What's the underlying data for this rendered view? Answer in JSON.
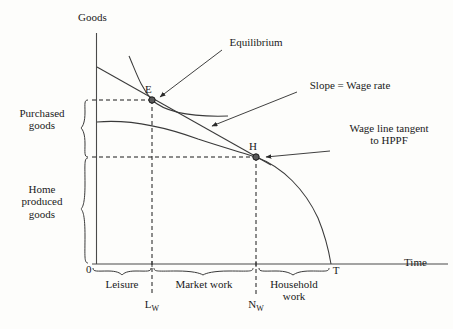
{
  "figure": {
    "type": "economics-diagram",
    "title_axes": {
      "y_axis_label": "Goods",
      "x_axis_label": "Time",
      "origin_label": "0"
    },
    "axis_ticks": {
      "x": [
        {
          "name": "L_W",
          "label": "L",
          "sub": "W",
          "x": 152
        },
        {
          "name": "N_W",
          "label": "N",
          "sub": "W",
          "x": 256
        },
        {
          "name": "T",
          "label": "T",
          "sub": "",
          "x": 331
        }
      ]
    },
    "points": [
      {
        "name": "E",
        "label": "E",
        "x": 152,
        "y": 100,
        "description": "Equilibrium point on indifference curve and wage line"
      },
      {
        "name": "H",
        "label": "H",
        "x": 256,
        "y": 157,
        "description": "Tangency of wage line to HPPF"
      }
    ],
    "annotations": [
      {
        "name": "equilibrium",
        "lines": [
          "Equilibrium"
        ],
        "x": 225,
        "y": 36
      },
      {
        "name": "slope-wage-rate",
        "lines": [
          "Slope = Wage rate"
        ],
        "x": 300,
        "y": 79
      },
      {
        "name": "wage-line-tangent",
        "lines": [
          "Wage line tangent",
          "to HPPF"
        ],
        "x": 333,
        "y": 122
      }
    ],
    "vertical_brackets": [
      {
        "name": "purchased-goods",
        "lines": [
          "Purchased",
          "goods"
        ],
        "top": 100,
        "bottom": 157,
        "label_x": 42,
        "label_y": 114
      },
      {
        "name": "home-produced-goods",
        "lines": [
          "Home",
          "produced",
          "goods"
        ],
        "top": 158,
        "bottom": 263,
        "label_x": 42,
        "label_y": 188
      }
    ],
    "horizontal_brackets": [
      {
        "name": "leisure",
        "lines": [
          "Leisure"
        ],
        "from": 92,
        "to": 152,
        "label_y": 278
      },
      {
        "name": "market-work",
        "lines": [
          "Market work"
        ],
        "from": 152,
        "to": 256,
        "label_y": 278
      },
      {
        "name": "household-work",
        "lines": [
          "Household",
          "work"
        ],
        "from": 256,
        "to": 331,
        "label_y": 278
      }
    ],
    "curves": [
      {
        "name": "indifference-curve",
        "description": "Convex indifference curve passing through E"
      },
      {
        "name": "hppf-curve",
        "description": "Household production possibility frontier from Goods axis through H to T"
      },
      {
        "name": "wage-line",
        "description": "Straight budget/wage line from Goods axis through E and H"
      }
    ],
    "colors": {
      "ink": "#1a1a1a",
      "line": "#333333",
      "background": "#fdfdfb",
      "point_fill": "#4d4d4d"
    }
  }
}
